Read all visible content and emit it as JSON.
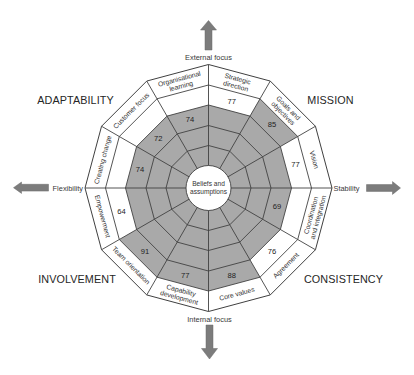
{
  "diagram": {
    "center_label": {
      "line1": "Beliefs and",
      "line2": "assumptions"
    },
    "axes": {
      "top": "External focus",
      "bottom": "Internal focus",
      "left": "Flexibility",
      "right": "Stability"
    },
    "quadrants": {
      "top_left": "ADAPTABILITY",
      "top_right": "MISSION",
      "bottom_left": "INVOLVEMENT",
      "bottom_right": "CONSISTENCY"
    },
    "ring_count": 4,
    "sectors": [
      {
        "trait": "MISSION",
        "label_lines": [
          "Strategic",
          "direction"
        ],
        "value": 77,
        "shaded_rings": 3
      },
      {
        "trait": "MISSION",
        "label_lines": [
          "Goals and",
          "objectives"
        ],
        "value": 85,
        "shaded_rings": 4
      },
      {
        "trait": "MISSION",
        "label_lines": [
          "Vision"
        ],
        "value": 77,
        "shaded_rings": 3
      },
      {
        "trait": "CONSISTENCY",
        "label_lines": [
          "Coordination",
          "and integration"
        ],
        "value": 69,
        "shaded_rings": 3
      },
      {
        "trait": "CONSISTENCY",
        "label_lines": [
          "Agreement"
        ],
        "value": 76,
        "shaded_rings": 3
      },
      {
        "trait": "CONSISTENCY",
        "label_lines": [
          "Core values"
        ],
        "value": 88,
        "shaded_rings": 4
      },
      {
        "trait": "INVOLVEMENT",
        "label_lines": [
          "Capability",
          "development"
        ],
        "value": 77,
        "shaded_rings": 4
      },
      {
        "trait": "INVOLVEMENT",
        "label_lines": [
          "Team orientation"
        ],
        "value": 91,
        "shaded_rings": 4
      },
      {
        "trait": "INVOLVEMENT",
        "label_lines": [
          "Empowerment"
        ],
        "value": 64,
        "shaded_rings": 3
      },
      {
        "trait": "ADAPTABILITY",
        "label_lines": [
          "Creating change"
        ],
        "value": 74,
        "shaded_rings": 3
      },
      {
        "trait": "ADAPTABILITY",
        "label_lines": [
          "Customer focus"
        ],
        "value": 72,
        "shaded_rings": 3
      },
      {
        "trait": "ADAPTABILITY",
        "label_lines": [
          "Organisational",
          "learning"
        ],
        "value": 74,
        "shaded_rings": 3
      }
    ],
    "icons": {
      "top_arrow": "arrow-up-icon",
      "bottom_arrow": "arrow-down-icon",
      "left_arrow": "arrow-left-icon",
      "right_arrow": "arrow-right-icon"
    },
    "colors": {
      "shade": "#a9a9a9",
      "grid_line": "#424242",
      "arrow": "#7c7c7c",
      "background": "#ffffff"
    }
  }
}
